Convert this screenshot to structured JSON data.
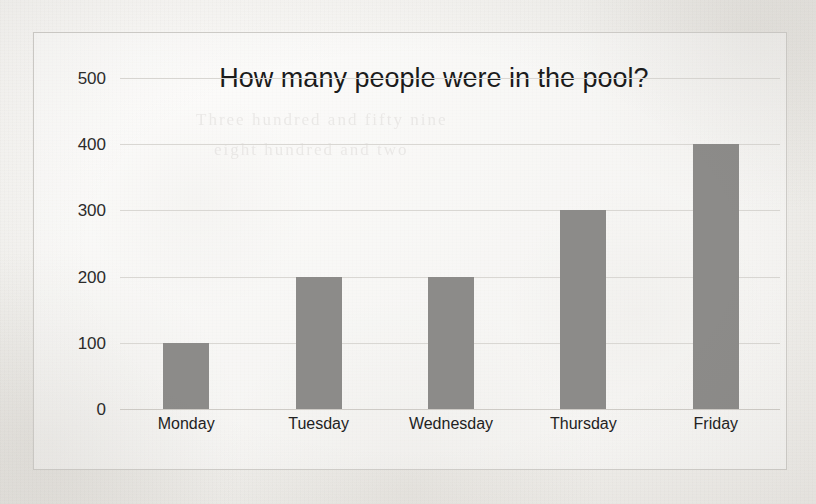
{
  "chart_data": {
    "type": "bar",
    "title": "How many people were in the pool?",
    "xlabel": "",
    "ylabel": "",
    "categories": [
      "Monday",
      "Tuesday",
      "Wednesday",
      "Thursday",
      "Friday"
    ],
    "values": [
      100,
      200,
      200,
      300,
      400
    ],
    "ylim": [
      0,
      500
    ],
    "ytick_labels": [
      "500",
      "400",
      "300",
      "200",
      "100",
      "0"
    ],
    "ytick_values": [
      500,
      400,
      300,
      200,
      100,
      0
    ],
    "ytick_step": 100,
    "grid": true,
    "legend": false,
    "bar_color": "#8c8b89",
    "gridline_color": "#d9d7d3",
    "title_color": "#1b1b1b",
    "axis_text_color": "#2b2b2b"
  },
  "page": {
    "background_color": "#f2f1ee",
    "frame_border_color": "#cfcdc9",
    "ghost_text": [
      "Three hundred and fifty nine",
      "eight hundred and two"
    ]
  }
}
